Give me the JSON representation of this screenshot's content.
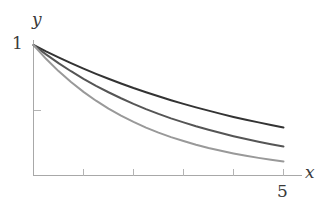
{
  "chart_data": {
    "type": "line",
    "title": "",
    "xlabel": "x",
    "ylabel": "y",
    "xlim": [
      0,
      5.6
    ],
    "ylim": [
      0,
      1.08
    ],
    "grid": false,
    "legend": "none",
    "x_tick_values": [
      0,
      1,
      2,
      3,
      4,
      5
    ],
    "x_tick_labels": [
      "",
      "",
      "",
      "",
      "",
      "5"
    ],
    "y_tick_values": [
      0.5,
      1
    ],
    "y_tick_labels": [
      "",
      "1"
    ],
    "annotations": [],
    "series": [
      {
        "name": "slow decay",
        "color": "#333333",
        "linewidth": 2.0,
        "x": [
          0,
          0.25,
          0.5,
          0.75,
          1,
          1.25,
          1.5,
          1.75,
          2,
          2.25,
          2.5,
          2.75,
          3,
          3.25,
          3.5,
          3.75,
          4,
          4.25,
          4.5,
          4.75,
          5
        ],
        "values": [
          1.0,
          0.951,
          0.905,
          0.861,
          0.819,
          0.779,
          0.741,
          0.705,
          0.67,
          0.638,
          0.607,
          0.577,
          0.549,
          0.522,
          0.497,
          0.472,
          0.449,
          0.427,
          0.407,
          0.387,
          0.368
        ]
      },
      {
        "name": "medium decay",
        "color": "#555555",
        "linewidth": 2.0,
        "x": [
          0,
          0.25,
          0.5,
          0.75,
          1,
          1.25,
          1.5,
          1.75,
          2,
          2.25,
          2.5,
          2.75,
          3,
          3.25,
          3.5,
          3.75,
          4,
          4.25,
          4.5,
          4.75,
          5
        ],
        "values": [
          1.0,
          0.928,
          0.861,
          0.799,
          0.741,
          0.687,
          0.638,
          0.592,
          0.549,
          0.509,
          0.472,
          0.438,
          0.407,
          0.377,
          0.35,
          0.325,
          0.301,
          0.279,
          0.259,
          0.24,
          0.223
        ]
      },
      {
        "name": "fast decay",
        "color": "#999999",
        "linewidth": 2.0,
        "x": [
          0,
          0.25,
          0.5,
          0.75,
          1,
          1.25,
          1.5,
          1.75,
          2,
          2.25,
          2.5,
          2.75,
          3,
          3.25,
          3.5,
          3.75,
          4,
          4.25,
          4.5,
          4.75,
          5
        ],
        "values": [
          1.0,
          0.894,
          0.8,
          0.716,
          0.641,
          0.573,
          0.513,
          0.459,
          0.411,
          0.367,
          0.329,
          0.294,
          0.264,
          0.236,
          0.211,
          0.189,
          0.169,
          0.151,
          0.135,
          0.121,
          0.108
        ]
      }
    ]
  },
  "axes": {
    "y_label": "y",
    "x_label": "x",
    "y_top_tick_label": "1",
    "x_end_tick_label": "5",
    "axis_color": "#a8a8a8",
    "tick_color": "#b4b4b4"
  }
}
